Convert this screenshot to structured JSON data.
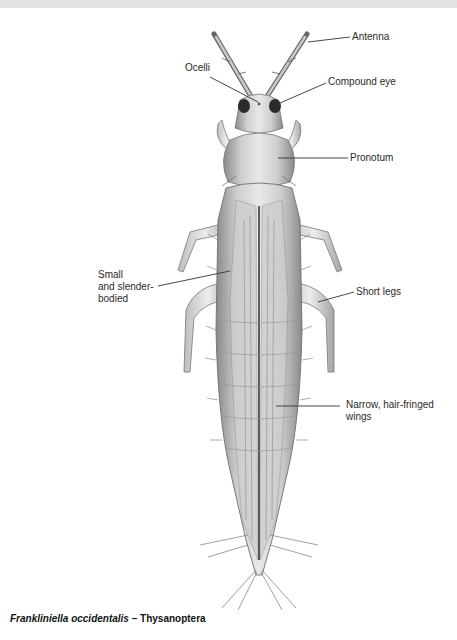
{
  "figure": {
    "species": "Frankliniella occidentalis",
    "separator": " – ",
    "order": "Thysanoptera"
  },
  "labels": {
    "antenna": "Antenna",
    "ocelli": "Ocelli",
    "compound_eye": "Compound eye",
    "pronotum": "Pronotum",
    "small_slender": "Small\nand slender-\nbodied",
    "short_legs": "Short legs",
    "wings": "Narrow, hair-fringed\nwings"
  },
  "colors": {
    "background": "#ffffff",
    "leader_line": "#333333",
    "body_fill": "#d9d9d9",
    "body_shade": "#9a9a9a",
    "eye": "#2b2b2b"
  }
}
